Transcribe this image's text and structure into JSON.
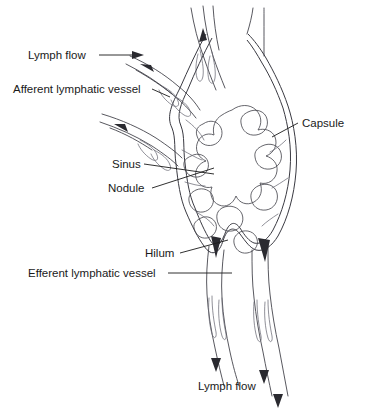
{
  "figure": {
    "background_color": "#ffffff",
    "ink_color": "#1a1a1a"
  },
  "labels": {
    "lymph_flow_top": "Lymph flow",
    "afferent_vessel": "Afferent lymphatic vessel",
    "capsule": "Capsule",
    "sinus": "Sinus",
    "nodule": "Nodule",
    "hilum": "Hilum",
    "efferent_vessel": "Efferent lymphatic vessel",
    "lymph_flow_bottom": "Lymph flow"
  },
  "structures": {
    "capsule": "outer double-lined boundary of the lymph node",
    "nodule": "stippled lobular masses inside the node",
    "sinus": "clear channels between nodules and capsule",
    "hilum": "indentation where efferent vessels exit",
    "afferent_count": 3,
    "efferent_count": 2
  },
  "flow_arrows": {
    "afferent_directions": "into the node",
    "efferent_directions": "out of the node, downward",
    "count": 8
  }
}
